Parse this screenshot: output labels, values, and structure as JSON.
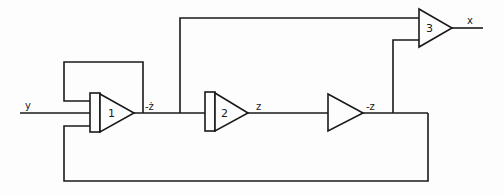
{
  "diagram": {
    "title": "",
    "type": "analog computer block diagram",
    "signals": {
      "input": "y",
      "amp1_output": "-ż",
      "amp2_output": "z",
      "inverter_output": "-z",
      "amp3_output": "x"
    },
    "amplifiers": [
      {
        "id": "1",
        "label": "1",
        "kind": "integrator"
      },
      {
        "id": "2",
        "label": "2",
        "kind": "integrator"
      },
      {
        "id": "inv",
        "label": "",
        "kind": "inverter"
      },
      {
        "id": "3",
        "label": "3",
        "kind": "summer"
      }
    ]
  }
}
